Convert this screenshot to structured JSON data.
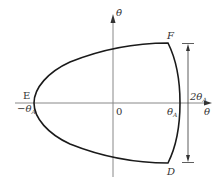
{
  "diagram": {
    "type": "phase-plane",
    "axes": {
      "x_label": "θ",
      "y_label": "θ̇",
      "origin_label": "0"
    },
    "points": {
      "E": {
        "label": "E",
        "value_label": "−θ",
        "value_sub": "A"
      },
      "F": {
        "label": "F"
      },
      "D": {
        "label": "D"
      },
      "right_intercept": {
        "value_label": "θ",
        "value_sub": "A"
      }
    },
    "dimension": {
      "label": "2θ",
      "sub": "A"
    },
    "colors": {
      "curve": "#1a1a1a",
      "axis": "#777777",
      "text": "#333333"
    }
  }
}
